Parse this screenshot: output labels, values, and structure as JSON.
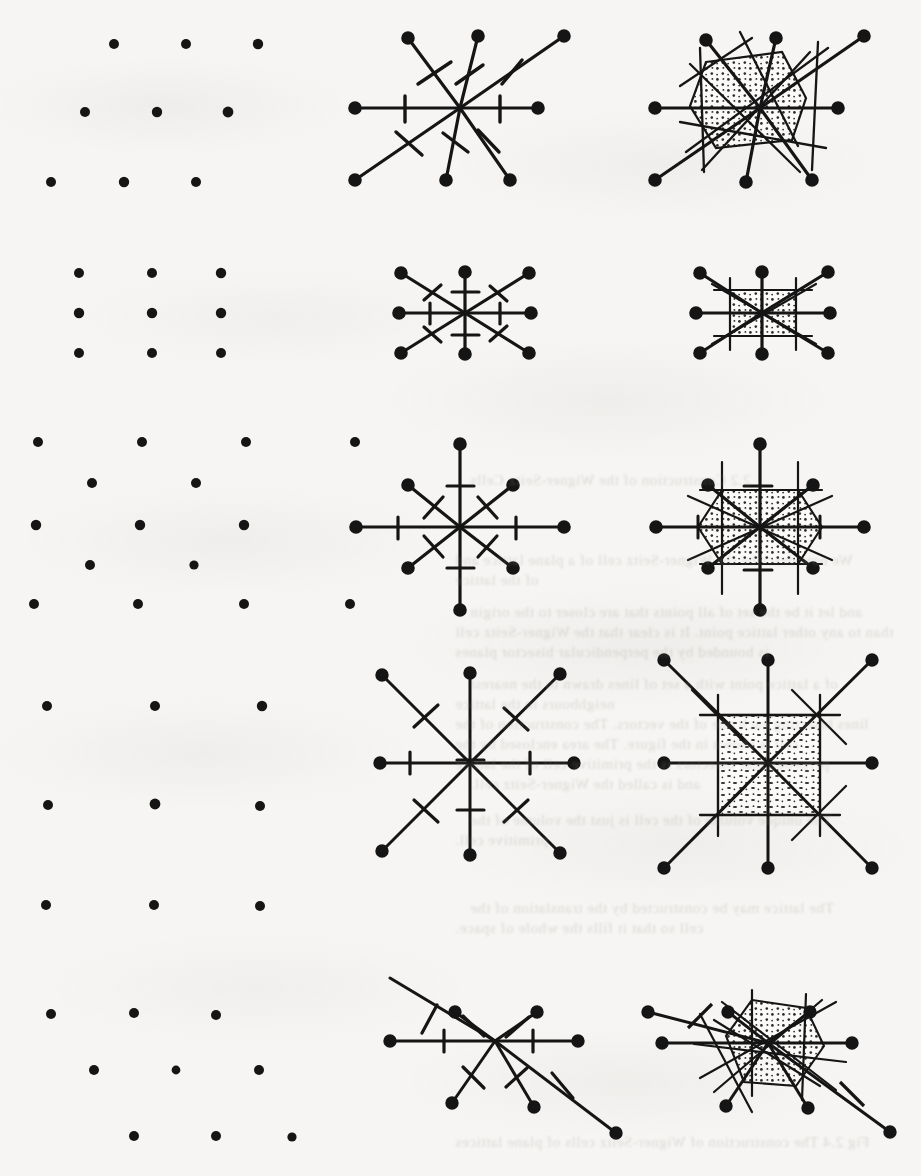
{
  "figure": {
    "page_background": "#f6f5f3",
    "ink_color": "#171717",
    "stipple_color": "#2a2a2a",
    "width": 921,
    "height": 1176,
    "columns": [
      {
        "index": 0,
        "name": "bravais-lattice",
        "description": "lattice points"
      },
      {
        "index": 1,
        "name": "neighbour-star",
        "description": "vectors to neighbours with perpendicular bisector tick marks"
      },
      {
        "index": 2,
        "name": "wigner-seitz-cell",
        "description": "perpendicular bisector lines bounding the stippled Wigner-Seitz cell"
      }
    ],
    "rows": [
      {
        "index": 0,
        "name": "oblique-lattice",
        "cy": 110,
        "lattice": {
          "a1": [
            72,
            0
          ],
          "a2": [
            -33,
            72
          ],
          "nx": 3,
          "ny": 3,
          "origin": [
            128,
            45
          ]
        },
        "star": {
          "cx": 460,
          "cy": 108,
          "vectors": [
            [
              -52,
              -70
            ],
            [
              18,
              -72
            ],
            [
              104,
              -72
            ],
            [
              -105,
              0
            ],
            [
              78,
              0
            ],
            [
              -105,
              72
            ],
            [
              -14,
              72
            ],
            [
              50,
              72
            ]
          ]
        },
        "cell": {
          "cx": 760,
          "cy": 108,
          "shape": "hexagon",
          "shaded": true
        }
      },
      {
        "index": 1,
        "name": "rectangular-lattice-tall",
        "cy": 312,
        "lattice": {
          "a1": [
            66,
            0
          ],
          "a2": [
            0,
            42
          ],
          "nx": 3,
          "ny": 3,
          "origin": [
            88,
            272
          ]
        },
        "star": {
          "cx": 465,
          "cy": 313,
          "vectors": [
            [
              -66,
              -42
            ],
            [
              0,
              -42
            ],
            [
              66,
              -42
            ],
            [
              -66,
              0
            ],
            [
              66,
              0
            ],
            [
              -66,
              42
            ],
            [
              0,
              42
            ],
            [
              66,
              42
            ]
          ]
        },
        "cell": {
          "cx": 762,
          "cy": 313,
          "shape": "rectangle",
          "shaded": true
        }
      },
      {
        "index": 2,
        "name": "centred-rectangular-lattice",
        "cy": 525,
        "lattice": {
          "a1": [
            104,
            0
          ],
          "a2": [
            52,
            46
          ],
          "nx": 4,
          "ny": 3,
          "origin": [
            38,
            444
          ]
        },
        "star": {
          "cx": 460,
          "cy": 527,
          "vectors": [
            [
              0,
              -92
            ],
            [
              -52,
              -46
            ],
            [
              52,
              -46
            ],
            [
              -104,
              0
            ],
            [
              104,
              0
            ],
            [
              -52,
              46
            ],
            [
              52,
              46
            ],
            [
              0,
              92
            ]
          ]
        },
        "cell": {
          "cx": 760,
          "cy": 527,
          "shape": "hexagon",
          "shaded": true
        }
      },
      {
        "index": 3,
        "name": "square-lattice",
        "cy": 762,
        "lattice": {
          "a1": [
            88,
            0
          ],
          "a2": [
            0,
            88
          ],
          "nx": 3,
          "ny": 3,
          "origin": [
            46,
            698
          ]
        },
        "star": {
          "cx": 470,
          "cy": 763,
          "vectors": [
            [
              -88,
              -88
            ],
            [
              0,
              -88
            ],
            [
              88,
              -88
            ],
            [
              -88,
              0
            ],
            [
              88,
              0
            ],
            [
              -88,
              88
            ],
            [
              0,
              88
            ],
            [
              88,
              88
            ]
          ]
        },
        "cell": {
          "cx": 768,
          "cy": 763,
          "shape": "square",
          "shaded": true
        }
      },
      {
        "index": 4,
        "name": "hexagonal-lattice",
        "cy": 1040,
        "lattice": {
          "a1": [
            78,
            0
          ],
          "a2": [
            39,
            68
          ],
          "nx": 3,
          "ny": 3,
          "origin": [
            50,
            992
          ]
        },
        "star": {
          "cx": 495,
          "cy": 1041,
          "vectors": [
            [
              -78,
              -52
            ],
            [
              -16,
              -62
            ],
            [
              48,
              -62
            ],
            [
              -95,
              0
            ],
            [
              88,
              0
            ],
            [
              -57,
              62
            ],
            [
              8,
              68
            ],
            [
              99,
              68
            ]
          ]
        },
        "cell": {
          "cx": 790,
          "cy": 1041,
          "shape": "hexagon",
          "shaded": true
        }
      }
    ]
  },
  "bleed_through": {
    "note": "illegible mirrored text printed on the reverse of the scanned sheet",
    "lines": [
      {
        "x": 470,
        "y": 472,
        "text": "2.2 Construction of the Wigner-Seitz Cells"
      },
      {
        "x": 455,
        "y": 552,
        "text": "We now describe the Wigner-Seitz cell of a plane lattice and"
      },
      {
        "x": 455,
        "y": 572,
        "text": "of the lattice"
      },
      {
        "x": 470,
        "y": 604,
        "text": "and let it be the set of all points that are closer to the origin"
      },
      {
        "x": 455,
        "y": 624,
        "text": "than to any other lattice point. It is clear that the Wigner-Seitz cell"
      },
      {
        "x": 455,
        "y": 644,
        "text": "is bounded by the perpendicular bisector planes"
      },
      {
        "x": 470,
        "y": 676,
        "text": "of a lattice point with a set of lines drawn to the nearest"
      },
      {
        "x": 455,
        "y": 696,
        "text": "neighbours in the lattice"
      },
      {
        "x": 455,
        "y": 716,
        "text": "lines bisecting each one of the vectors. The construction of the"
      },
      {
        "x": 455,
        "y": 736,
        "text": "cell is shown in the figure. The area enclosed by the"
      },
      {
        "x": 455,
        "y": 756,
        "text": "perpendicular bisectors is the primitive cell of the lattice"
      },
      {
        "x": 470,
        "y": 776,
        "text": "and is called the Wigner-Seitz cell."
      },
      {
        "x": 470,
        "y": 812,
        "text": "The unique volume of the cell is just the volume of the"
      },
      {
        "x": 455,
        "y": 832,
        "text": "primitive cell."
      },
      {
        "x": 470,
        "y": 900,
        "text": "The lattice may be constructed by the translation of the"
      },
      {
        "x": 455,
        "y": 920,
        "text": "cell so that it fills the whole of space."
      },
      {
        "x": 455,
        "y": 1134,
        "text": "Fig 2.4 The construction of Wigner-Seitz cells of plane lattices"
      }
    ]
  }
}
